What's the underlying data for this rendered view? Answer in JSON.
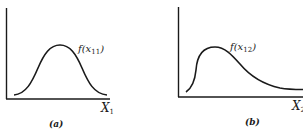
{
  "panels": [
    {
      "id": "a",
      "caption": "(a)",
      "curve_label": {
        "fn": "f(x",
        "sub": "11",
        "close": ")"
      },
      "axis_label": {
        "name": "X",
        "sub": "1"
      },
      "shape": "symmetric bell"
    },
    {
      "id": "b",
      "caption": "(b)",
      "curve_label": {
        "fn": "f(x",
        "sub": "12",
        "close": ")"
      },
      "axis_label": {
        "name": "X",
        "sub": "2"
      },
      "shape": "right-skewed"
    }
  ],
  "colors": {
    "ink": "#1a1a1a",
    "background": "#ffffff"
  }
}
